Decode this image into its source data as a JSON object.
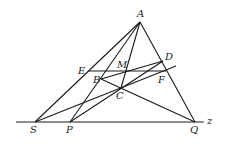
{
  "diagram": {
    "type": "geometry-figure",
    "points": {
      "A": {
        "x": 140,
        "y": 22,
        "lx": 137,
        "ly": 17
      },
      "D": {
        "x": 163,
        "y": 61,
        "lx": 165,
        "ly": 60
      },
      "E": {
        "x": 88,
        "y": 71,
        "lx": 78,
        "ly": 74
      },
      "M": {
        "x": 126,
        "y": 71,
        "lx": 117,
        "ly": 68
      },
      "F": {
        "x": 164,
        "y": 72,
        "lx": 158,
        "ly": 83
      },
      "B": {
        "x": 101,
        "y": 79,
        "lx": 93,
        "ly": 83
      },
      "C": {
        "x": 121,
        "y": 88,
        "lx": 116,
        "ly": 99
      },
      "S": {
        "x": 35,
        "y": 122,
        "lx": 30,
        "ly": 133
      },
      "P": {
        "x": 70,
        "y": 122,
        "lx": 66,
        "ly": 133
      },
      "Q": {
        "x": 195,
        "y": 122,
        "lx": 190,
        "ly": 133
      }
    },
    "labels": [
      "A",
      "D",
      "E",
      "M",
      "F",
      "B",
      "C",
      "S",
      "P",
      "Q",
      "z"
    ],
    "axis_label": {
      "text": "z",
      "x": 207,
      "y": 124
    },
    "lines": [
      {
        "name": "line-z",
        "x1": 16,
        "y1": 122,
        "x2": 204,
        "y2": 122
      },
      {
        "name": "segment-AS",
        "x1": 140,
        "y1": 22,
        "x2": 35,
        "y2": 122
      },
      {
        "name": "segment-AP",
        "x1": 140,
        "y1": 22,
        "x2": 70,
        "y2": 122
      },
      {
        "name": "segment-AC",
        "x1": 140,
        "y1": 22,
        "x2": 121,
        "y2": 88
      },
      {
        "name": "segment-AQ",
        "x1": 140,
        "y1": 22,
        "x2": 195,
        "y2": 122
      },
      {
        "name": "segment-EF",
        "x1": 88,
        "y1": 71,
        "x2": 166,
        "y2": 71
      },
      {
        "name": "segment-BD",
        "x1": 101,
        "y1": 79,
        "x2": 163,
        "y2": 61
      },
      {
        "name": "segment-BQ",
        "x1": 101,
        "y1": 79,
        "x2": 195,
        "y2": 122
      },
      {
        "name": "line-SC-extended",
        "x1": 35,
        "y1": 122,
        "x2": 176,
        "y2": 66
      },
      {
        "name": "segment-PD",
        "x1": 70,
        "y1": 122,
        "x2": 163,
        "y2": 61
      }
    ]
  }
}
